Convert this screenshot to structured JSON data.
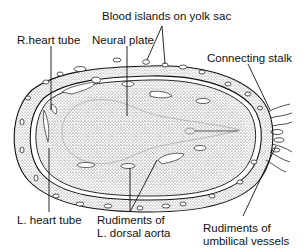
{
  "figure": {
    "labels": {
      "blood_islands": "Blood islands on yolk sac",
      "r_heart_tube": "R.heart tube",
      "neural_plate": "Neural plate",
      "connecting_stalk": "Connecting stalk",
      "l_heart_tube": "L. heart tube",
      "dorsal_aorta": "Rudiments of\nL. dorsal aorta",
      "umbilical_vessels": "Rudiments of\numbilical vessels"
    },
    "colors": {
      "ink": "#111111",
      "stipple": "#555555",
      "background": "#ffffff"
    }
  }
}
